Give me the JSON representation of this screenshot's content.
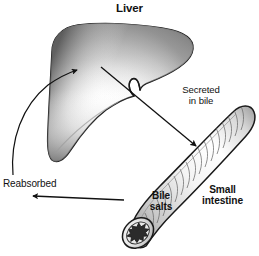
{
  "figure": {
    "title": "Liver",
    "background_color": "#ffffff",
    "ink_color": "#111111",
    "width": 259,
    "height": 256
  },
  "labels": {
    "liver": "Liver",
    "secreted_in_bile": "Secreted\nin bile",
    "small_intestine": "Small\nintestine",
    "bile_salts": "Bile\nsalts",
    "reabsorbed": "Reabsorbed"
  },
  "organs": [
    {
      "name": "liver",
      "label": "Liver",
      "shading": "gradient-gray-to-white",
      "outline_color": "#1a1a1a"
    },
    {
      "name": "small-intestine",
      "label": "Small intestine",
      "shading": "hatched-tube",
      "outline_color": "#1a1a1a",
      "cut_end": "star-shaped-lumen"
    }
  ],
  "arrows": [
    {
      "name": "secreted-in-bile-arrow",
      "label": "Secreted in bile",
      "from": "liver",
      "to": "small-intestine",
      "direction": "down-right",
      "style": "straight"
    },
    {
      "name": "reabsorbed-arrow-horizontal",
      "label": "Reabsorbed",
      "from": "small-intestine",
      "to": "left",
      "direction": "left",
      "style": "straight"
    },
    {
      "name": "reabsorbed-arrow-curved",
      "label": "Reabsorbed",
      "from": "left",
      "to": "liver",
      "direction": "up-right",
      "style": "curved"
    }
  ]
}
